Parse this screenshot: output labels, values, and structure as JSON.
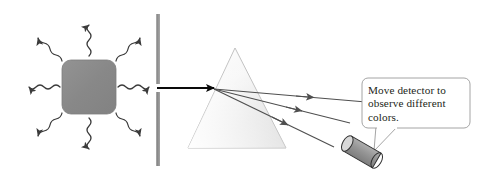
{
  "figure": {
    "background_color": "#ffffff",
    "width": 477,
    "height": 174
  },
  "light_source": {
    "label": "glowing-source-square",
    "fill_color": "#8a8a8a",
    "border_color": "#7a7a7a",
    "x": 62,
    "y": 60,
    "width": 54,
    "height": 54,
    "corner_radius": 9,
    "emission_ray_count": 8,
    "ray_color": "#3b3b3b",
    "ray_directions": [
      "up",
      "up-right",
      "right",
      "down-right",
      "down",
      "down-left",
      "left",
      "up-left"
    ]
  },
  "barrier": {
    "label": "slit-barrier",
    "color_top": "#9a9a9a",
    "color_bottom": "#8f8f8f",
    "x": 156,
    "thickness": 4,
    "top_segment": {
      "y1": 14,
      "y2": 84
    },
    "bottom_segment": {
      "y1": 92,
      "y2": 166
    },
    "slit_gap": {
      "y1": 84,
      "y2": 92
    }
  },
  "incident_beam": {
    "label": "incident-white-light-beam",
    "color": "#000000",
    "x1": 157,
    "y1": 88,
    "x2": 214,
    "y2": 88
  },
  "prism": {
    "label": "dispersing-prism",
    "apex": {
      "x": 235,
      "y": 48
    },
    "base_left": {
      "x": 188,
      "y": 148
    },
    "base_right": {
      "x": 286,
      "y": 148
    },
    "fill_light": "#fdfdfd",
    "fill_dark": "#e2e2e2",
    "stroke_color": "#b9b9b9"
  },
  "refracted_rays": {
    "label": "dispersed-color-rays",
    "color": "#4a4a4a",
    "count": 3,
    "origin": {
      "x": 214,
      "y": 89
    },
    "rays": [
      {
        "name": "ray-1-least-deviated",
        "x2": 366,
        "y2": 102
      },
      {
        "name": "ray-2-middle",
        "x2": 350,
        "y2": 123
      },
      {
        "name": "ray-3-most-deviated",
        "x2": 334,
        "y2": 147
      }
    ]
  },
  "detector": {
    "label": "movable-detector",
    "body_color": "#8f8f8f",
    "face_color": "#d8d8d8",
    "outline_color": "#2f2f2f",
    "center": {
      "x": 362,
      "y": 152
    },
    "angle_degrees": 30
  },
  "callout": {
    "label": "instruction-callout",
    "border_color": "#9a9a9a",
    "fill_color": "#ffffff",
    "text_color": "#231f20",
    "lines": [
      "Move detector to",
      "observe different",
      "colors."
    ],
    "full_text": "Move detector to observe different colors.",
    "box": {
      "x": 362,
      "y": 78,
      "width": 108,
      "height": 50,
      "radius": 6
    },
    "tail_tip": {
      "x": 374,
      "y": 150
    }
  }
}
